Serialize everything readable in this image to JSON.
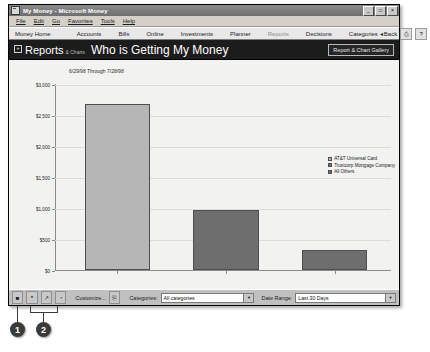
{
  "window": {
    "title": "My Money - Microsoft Money",
    "icon": "money-document-icon",
    "caption_buttons": [
      {
        "name": "minimize-button",
        "glyph": "_"
      },
      {
        "name": "maximize-button",
        "glyph": "□"
      },
      {
        "name": "close-button",
        "glyph": "×"
      }
    ]
  },
  "menu": {
    "items": [
      {
        "label": "File",
        "mnemonic": "F"
      },
      {
        "label": "Edit",
        "mnemonic": "E"
      },
      {
        "label": "Go",
        "mnemonic": "G"
      },
      {
        "label": "Favorites",
        "mnemonic": "a"
      },
      {
        "label": "Tools",
        "mnemonic": "T"
      },
      {
        "label": "Help",
        "mnemonic": "H"
      }
    ]
  },
  "nav": {
    "home_label": "Money Home",
    "items": [
      {
        "label": "Accounts",
        "active": false
      },
      {
        "label": "Bills",
        "active": false
      },
      {
        "label": "Online",
        "active": false
      },
      {
        "label": "Investments",
        "active": false
      },
      {
        "label": "Planner",
        "active": false
      },
      {
        "label": "Reports",
        "active": true
      },
      {
        "label": "Decisions",
        "active": false
      },
      {
        "label": "Categories",
        "active": false
      }
    ],
    "back_label": "Back",
    "back_glyph": "◂",
    "icons": [
      {
        "name": "print-icon",
        "glyph": "⎙"
      },
      {
        "name": "help-icon",
        "glyph": "?"
      }
    ]
  },
  "header": {
    "section_label": "Reports",
    "section_sublabel": "& Charts",
    "expand_glyph": "+",
    "page_title": "Who is Getting My Money",
    "gallery_button": "Report & Chart Gallery"
  },
  "toolbar": {
    "icons": [
      {
        "name": "report-view-icon",
        "glyph": "■"
      },
      {
        "name": "bar-chart-icon",
        "glyph": "ᵜ"
      },
      {
        "name": "line-chart-icon",
        "glyph": "↗"
      },
      {
        "name": "pie-chart-icon",
        "glyph": "◔"
      }
    ],
    "customize_label": "Customize...",
    "export_icon": "export-icon",
    "export_glyph": "⎘",
    "categories_label": "Categories:",
    "categories_value": "All categories",
    "daterange_label": "Date Range:",
    "daterange_value": "Last 30 Days",
    "dropdown_glyph": "▼"
  },
  "callouts": [
    {
      "label": "1"
    },
    {
      "label": "2"
    }
  ],
  "chart_data": {
    "type": "bar",
    "title": "Who is Getting My Money",
    "subtitle": "6/29/98 Through 7/28/98",
    "categories": [
      "AT&T Universal Card",
      "Trustcorp Mortgage Company",
      "All Others"
    ],
    "values": [
      2680,
      965,
      330
    ],
    "colors": [
      "#b6b6b6",
      "#6e6e6e",
      "#6e6e6e"
    ],
    "xlabel": "",
    "ylabel": "",
    "ylim": [
      0,
      3000
    ],
    "yticks": [
      0,
      500,
      1000,
      1500,
      2000,
      2500,
      3000
    ],
    "ytick_labels": [
      "$0",
      "$500",
      "$1,000",
      "$1,500",
      "$2,000",
      "$2,500",
      "$3,000"
    ],
    "grid": true,
    "legend_position": "right",
    "legend": [
      {
        "label": "AT&T Universal Card",
        "color": "#b6b6b6"
      },
      {
        "label": "Trustcorp Mortgage Company",
        "color": "#6e6e6e"
      },
      {
        "label": "All Others",
        "color": "#6e6e6e"
      }
    ]
  }
}
